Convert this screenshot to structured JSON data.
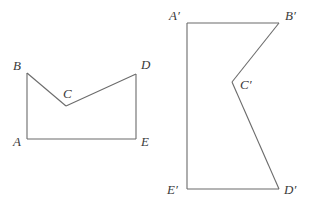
{
  "figures": [
    {
      "name": "original-pentagon",
      "vertices": [
        {
          "label": "A"
        },
        {
          "label": "B"
        },
        {
          "label": "C"
        },
        {
          "label": "D"
        },
        {
          "label": "E"
        }
      ]
    },
    {
      "name": "image-pentagon",
      "vertices": [
        {
          "label": "A′"
        },
        {
          "label": "B′"
        },
        {
          "label": "C′"
        },
        {
          "label": "D′"
        },
        {
          "label": "E′"
        }
      ]
    }
  ],
  "colors": {
    "stroke": "#6b6b6b",
    "label": "#3a3a3a",
    "background": "#ffffff"
  }
}
